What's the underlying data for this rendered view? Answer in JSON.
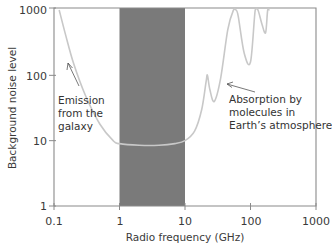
{
  "chart_data": {
    "type": "line",
    "title": "",
    "xlabel": "Radio frequency (GHz)",
    "ylabel": "Background noise level",
    "xscale": "log",
    "yscale": "log",
    "xlim": [
      0.1,
      1000
    ],
    "ylim": [
      1,
      1000
    ],
    "xticks": [
      "0.1",
      "1",
      "10",
      "100",
      "1000"
    ],
    "yticks": [
      "1",
      "10",
      "100",
      "1000"
    ],
    "grid": false,
    "legend": null,
    "shaded_region": {
      "x_from": 1,
      "x_to": 10,
      "color": "#7a7a7a",
      "label": "radio window"
    },
    "series": [
      {
        "name": "Background noise",
        "color": "#c8c8c8",
        "x": [
          0.12,
          0.15,
          0.2,
          0.3,
          0.5,
          0.8,
          1,
          2,
          4,
          7,
          10,
          14,
          18,
          21,
          22,
          24,
          28,
          35,
          45,
          55,
          60,
          65,
          80,
          100,
          118,
          130,
          150,
          170,
          183,
          195
        ],
        "y": [
          1000,
          420,
          150,
          50,
          18,
          10,
          9,
          8.5,
          8.5,
          9,
          10,
          14,
          30,
          80,
          100,
          60,
          40,
          90,
          500,
          1000,
          1000,
          800,
          220,
          160,
          1000,
          1000,
          600,
          450,
          1000,
          1000
        ]
      }
    ],
    "annotations": [
      {
        "text": [
          "Emission",
          "from the",
          "galaxy"
        ],
        "arrow_to": {
          "x": 0.12,
          "y": 150
        }
      },
      {
        "text": [
          "Absorption by",
          "molecules in",
          "Earth’s atmosphere"
        ],
        "arrow_to": {
          "x": 22,
          "y": 100
        }
      }
    ]
  },
  "labels": {
    "xlabel": "Radio frequency (GHz)",
    "ylabel": "Background noise level",
    "xticks": [
      "0.1",
      "1",
      "10",
      "100",
      "1000"
    ],
    "yticks": [
      "1",
      "10",
      "100",
      "1000"
    ],
    "galaxy_note": [
      "Emission",
      "from the",
      "galaxy"
    ],
    "atmosphere_note": [
      "Absorption by",
      "molecules in",
      "Earth’s atmosphere"
    ]
  }
}
